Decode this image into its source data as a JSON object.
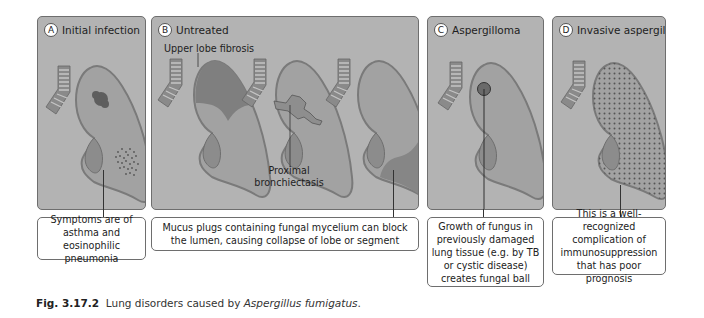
{
  "panels": [
    {
      "letter": "A",
      "title": "Initial infection",
      "description": "Symptoms are of asthma and eosinophilic pneumonia"
    },
    {
      "letter": "B",
      "title": "Untreated",
      "labels": {
        "upper": "Upper lobe fibrosis",
        "proximal_line1": "Proximal",
        "proximal_line2": "bronchiectasis"
      },
      "description": "Mucus plugs containing fungal mycelium can block the lumen, causing collapse of lobe or segment"
    },
    {
      "letter": "C",
      "title": "Aspergilloma",
      "description": "Growth of fungus in previously damaged lung tissue (e.g. by TB or cystic disease) creates fungal ball"
    },
    {
      "letter": "D",
      "title": "Invasive aspergillosis",
      "description": "This is a well-recognized complication of immunosuppression that has poor prognosis"
    }
  ],
  "caption": {
    "figure_number": "Fig. 3.17.2",
    "text": "Lung disorders caused by",
    "organism": "Aspergillus fumigatus",
    "end": "."
  },
  "colors": {
    "panel_bg": "#b3b3b3",
    "lung_fill": "#9c9c9c",
    "lung_edge": "#7a7a7a",
    "lesion": "#6a6a6a"
  }
}
